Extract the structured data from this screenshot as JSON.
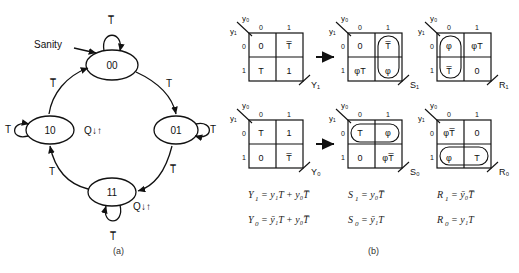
{
  "figure": {
    "caption_a": "(a)",
    "caption_b": "(b)"
  },
  "state_diagram": {
    "name": "state-transition-diagram",
    "annotation_label": "Sanity",
    "states": [
      {
        "id": "s00",
        "label": "00",
        "self_loop_label": "T̅",
        "output_label": ""
      },
      {
        "id": "s01",
        "label": "01",
        "self_loop_label": "T",
        "output_label": ""
      },
      {
        "id": "s11",
        "label": "11",
        "self_loop_label": "T̅",
        "output_label": "Q↓↑"
      },
      {
        "id": "s10",
        "label": "10",
        "self_loop_label": "T",
        "output_label": "Q↓↑"
      }
    ],
    "transitions": [
      {
        "from": "00",
        "to": "01",
        "label": "T"
      },
      {
        "from": "01",
        "to": "11",
        "label": "T̅"
      },
      {
        "from": "11",
        "to": "10",
        "label": "T"
      },
      {
        "from": "10",
        "to": "00",
        "label": "T̅"
      }
    ]
  },
  "kmaps": {
    "row_axis_label": "y₁",
    "col_axis_label": "y₀",
    "col_headers": [
      "0",
      "1"
    ],
    "row_headers": [
      "0",
      "1"
    ],
    "maps": [
      {
        "name": "kmap-Y1",
        "output": "Y₁",
        "cells": [
          "0",
          "T̅",
          "T",
          "1"
        ],
        "groups": []
      },
      {
        "name": "kmap-Y0",
        "output": "Y₀",
        "cells": [
          "T",
          "1",
          "0",
          "T̅"
        ],
        "groups": []
      },
      {
        "name": "kmap-S1",
        "output": "S₁",
        "cells": [
          "0",
          "T̅",
          "φT",
          "φ"
        ],
        "groups": [
          "right-column"
        ]
      },
      {
        "name": "kmap-R1",
        "output": "R₁",
        "cells": [
          "φ",
          "φT",
          "T̅",
          "0"
        ],
        "groups": [
          "left-column"
        ]
      },
      {
        "name": "kmap-S0",
        "output": "S₀",
        "cells": [
          "T",
          "φ",
          "0",
          "φT̅"
        ],
        "groups": [
          "top-row"
        ]
      },
      {
        "name": "kmap-R0",
        "output": "R₀",
        "cells": [
          "φT̅",
          "0",
          "φ",
          "T"
        ],
        "groups": [
          "bottom-row"
        ]
      }
    ]
  },
  "equations": [
    {
      "name": "equation-Y1",
      "lhs": "Y",
      "lhs_sub": "1",
      "rhs": "= y₁T + y₀T̅"
    },
    {
      "name": "equation-Y0",
      "lhs": "Y",
      "lhs_sub": "0",
      "rhs": "= ȳ₁T + y₀T̅"
    },
    {
      "name": "equation-S1",
      "lhs": "S",
      "lhs_sub": "1",
      "rhs": "= y₀T̅"
    },
    {
      "name": "equation-S0",
      "lhs": "S",
      "lhs_sub": "0",
      "rhs": "= ȳ₁T"
    },
    {
      "name": "equation-R1",
      "lhs": "R",
      "lhs_sub": "1",
      "rhs": "= ȳ₀T̅"
    },
    {
      "name": "equation-R0",
      "lhs": "R",
      "lhs_sub": "0",
      "rhs": "= y₁T"
    }
  ],
  "arrows": {
    "transform_arrow_top": "→",
    "transform_arrow_bottom": "→"
  }
}
